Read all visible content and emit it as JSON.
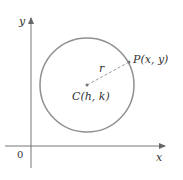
{
  "diagram": {
    "axes": {
      "x_label": "x",
      "y_label": "y",
      "origin_label": "0"
    },
    "circle": {
      "center_label": "C(h, k)",
      "point_label": "P(x, y)",
      "radius_label": "r",
      "stroke_color": "#8c8c8c"
    },
    "axis_color": "#666666"
  }
}
